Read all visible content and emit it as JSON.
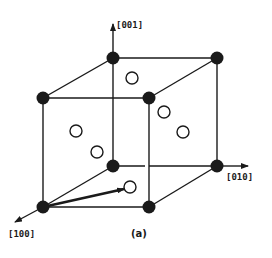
{
  "figure": {
    "caption": "(a)",
    "colors": {
      "line": "#1a1a1a",
      "corner_atom": "#1a1a1a",
      "face_atom_fill": "#ffffff",
      "background": "#ffffff"
    }
  },
  "axes": {
    "z": {
      "label": "[001]"
    },
    "y": {
      "label": "[010]"
    },
    "x": {
      "label": "[100]"
    }
  },
  "legend": {
    "corner_atoms": "filled circles",
    "face_center_atoms": "open circles"
  }
}
